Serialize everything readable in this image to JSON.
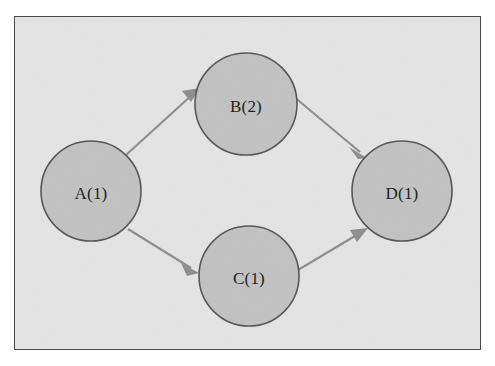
{
  "figure": {
    "kind": "directed-acyclic-graph",
    "frame": {
      "background_color": "#e4e4e4",
      "border_color": "#4a4a4a",
      "page_background_color": "#ffffff"
    },
    "node_style": {
      "fill_color": "#c2c2c2",
      "stroke_color": "#555555",
      "label_color": "#1b1b1b"
    },
    "edge_style": {
      "line_color": "#8d8d8d",
      "arrowhead_color": "#8d8d8d"
    }
  },
  "graph": {
    "nodes": [
      {
        "id": "A",
        "label": "A(1)",
        "name": "A",
        "weight": 1,
        "cx": 76,
        "cy": 174,
        "r": 50
      },
      {
        "id": "B",
        "label": "B(2)",
        "name": "B",
        "weight": 2,
        "cx": 231,
        "cy": 87,
        "r": 51
      },
      {
        "id": "C",
        "label": "C(1)",
        "name": "C",
        "weight": 1,
        "cx": 234,
        "cy": 259,
        "r": 50
      },
      {
        "id": "D",
        "label": "D(1)",
        "name": "D",
        "weight": 1,
        "cx": 387,
        "cy": 174,
        "r": 50
      }
    ],
    "edges": [
      {
        "from": "A",
        "to": "B",
        "directed": true
      },
      {
        "from": "A",
        "to": "C",
        "directed": true
      },
      {
        "from": "B",
        "to": "D",
        "directed": true
      },
      {
        "from": "C",
        "to": "D",
        "directed": true
      }
    ]
  }
}
